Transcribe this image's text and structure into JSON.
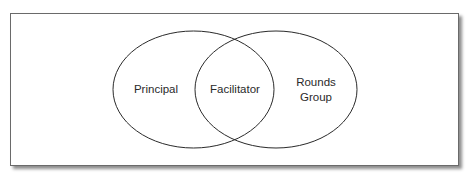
{
  "diagram": {
    "type": "venn",
    "sets": [
      {
        "id": "left",
        "label": "Principal"
      },
      {
        "id": "right",
        "label_lines": [
          "Rounds",
          "Group"
        ]
      }
    ],
    "intersection": {
      "label": "Facilitator"
    },
    "colors": {
      "stroke": "#2a2a2a",
      "text": "#2a2a2a",
      "frame": "#6a6a6a"
    }
  }
}
